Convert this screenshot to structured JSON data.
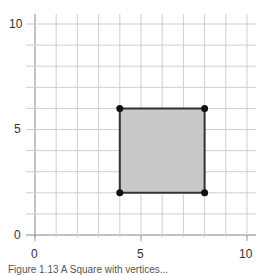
{
  "chart_data": {
    "type": "scatter",
    "title": "",
    "xlabel": "",
    "ylabel": "",
    "xlim": [
      0,
      10
    ],
    "ylim": [
      0,
      10
    ],
    "grid": true,
    "x_ticks": [
      0,
      5,
      10
    ],
    "y_ticks": [
      0,
      5,
      10
    ],
    "x_tick_labels": [
      "0",
      "5",
      "10"
    ],
    "y_tick_labels": [
      "0",
      "5",
      "10"
    ],
    "shape": {
      "kind": "square",
      "vertices": [
        [
          4,
          2
        ],
        [
          8,
          2
        ],
        [
          8,
          6
        ],
        [
          4,
          6
        ]
      ],
      "fill": "#c8c8c8",
      "stroke": "#333333"
    },
    "points": [
      {
        "x": 4,
        "y": 2
      },
      {
        "x": 8,
        "y": 2
      },
      {
        "x": 8,
        "y": 6
      },
      {
        "x": 4,
        "y": 6
      }
    ]
  },
  "caption": "Figure 1.13 A Square with vertices..."
}
